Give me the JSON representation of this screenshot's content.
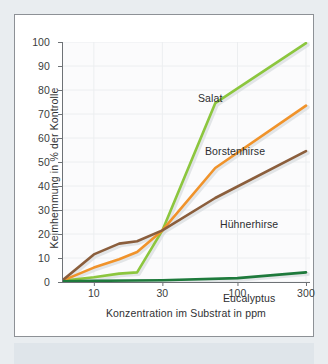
{
  "page": {
    "background_color": "#e9edf0",
    "card_background": "#ffffff",
    "card_border_color": "#8d9196",
    "band_color": "#dfe5ea"
  },
  "chart_data": {
    "type": "line",
    "title": "",
    "xlabel": "Konzentration im Substrat in ppm",
    "ylabel": "Keimhemmung in % der Kontrolle",
    "xscale": "log",
    "xlim": [
      6,
      320
    ],
    "ylim": [
      0,
      100
    ],
    "xticks": [
      10,
      30,
      100,
      300
    ],
    "xticklabels": [
      "10",
      "30",
      "100",
      "300"
    ],
    "yticks": [
      0,
      10,
      20,
      30,
      40,
      50,
      60,
      70,
      80,
      90,
      100
    ],
    "yticklabels": [
      "0",
      "10",
      "20",
      "30",
      "40",
      "50",
      "60",
      "70",
      "80",
      "90",
      "100"
    ],
    "grid": true,
    "legend": "inline-labels",
    "series": [
      {
        "name": "Salat",
        "color": "#8cc63e",
        "x": [
          6,
          10,
          15,
          20,
          30,
          70,
          300
        ],
        "values": [
          0.5,
          2.0,
          3.5,
          4.0,
          21.5,
          74.5,
          99.5
        ]
      },
      {
        "name": "Borstenhirse",
        "color": "#f0932b",
        "x": [
          6,
          10,
          15,
          20,
          30,
          70,
          300
        ],
        "values": [
          0.5,
          6.0,
          9.5,
          12.5,
          21.5,
          47.5,
          73.5
        ]
      },
      {
        "name": "Hühnerhirse",
        "color": "#8b5e3c",
        "x": [
          6,
          10,
          15,
          20,
          30,
          70,
          300
        ],
        "values": [
          0.5,
          11.5,
          16.0,
          17.0,
          21.5,
          35.0,
          54.5
        ]
      },
      {
        "name": "Eucalyptus",
        "color": "#1e7a3c",
        "x": [
          6,
          10,
          30,
          100,
          300
        ],
        "values": [
          0.3,
          0.5,
          0.7,
          1.6,
          4.0
        ]
      }
    ],
    "annotations": [
      {
        "text": "Salat",
        "x_px": 183,
        "y_px": 77
      },
      {
        "text": "Borstenhirse",
        "x_px": 190,
        "y_px": 130
      },
      {
        "text": "Hühnerhirse",
        "x_px": 205,
        "y_px": 203
      },
      {
        "text": "Eucalyptus",
        "x_px": 208,
        "y_px": 277
      }
    ]
  }
}
